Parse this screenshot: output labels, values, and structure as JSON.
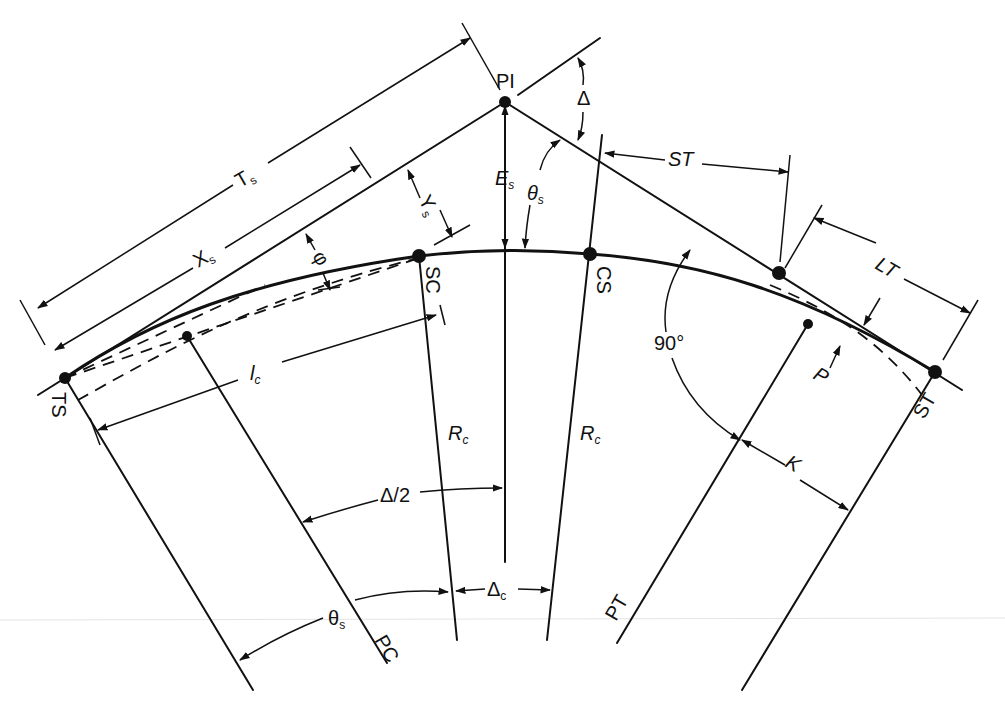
{
  "diagram": {
    "colors": {
      "ink": "#111111",
      "background": "#ffffff"
    },
    "points": {
      "pi": "PI",
      "ts": "TS",
      "sc": "SC",
      "cs": "CS",
      "st": "ST",
      "pc": "PC",
      "pt": "PT"
    },
    "dimensions": {
      "ts_tangent": {
        "main": "T",
        "sub": "s"
      },
      "xs": {
        "main": "X",
        "sub": "s"
      },
      "ys": {
        "main": "Y",
        "sub": "s"
      },
      "es": {
        "main": "E",
        "sub": "s"
      },
      "theta_s_top": {
        "main": "θ",
        "sub": "s"
      },
      "theta_s_bottom": {
        "main": "θ",
        "sub": "s"
      },
      "delta": "Δ",
      "delta_half": "Δ/2",
      "delta_c": {
        "main": "Δ",
        "sub": "c"
      },
      "phi": "φ",
      "lc": {
        "main": "l",
        "sub": "c"
      },
      "rc_left": {
        "main": "R",
        "sub": "c"
      },
      "rc_right": {
        "main": "R",
        "sub": "c"
      },
      "short_tangent": "ST",
      "long_tangent": "LT",
      "p": "P",
      "k": "K",
      "right_angle": "90°"
    }
  }
}
